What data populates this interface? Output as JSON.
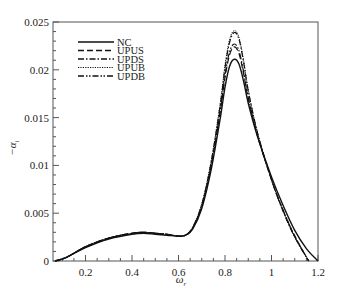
{
  "chart_data": {
    "type": "line",
    "title": "",
    "xlabel": "ω_r",
    "ylabel": "−α_i",
    "xlim": [
      0.06,
      1.2
    ],
    "ylim": [
      0,
      0.025
    ],
    "xticks": [
      0.2,
      0.4,
      0.6,
      0.8,
      1.0,
      1.2
    ],
    "xtick_labels": [
      "0.2",
      "0.4",
      "0.6",
      "0.8",
      "1",
      "1.2"
    ],
    "yticks": [
      0,
      0.005,
      0.01,
      0.015,
      0.02,
      0.025
    ],
    "ytick_labels": [
      "0",
      "0.005",
      "0.01",
      "0.015",
      "0.02",
      "0.025"
    ],
    "grid": false,
    "legend_position": "upper-left",
    "series": [
      {
        "name": "NC",
        "style": "solid",
        "x": [
          0.07,
          0.12,
          0.2,
          0.3,
          0.4,
          0.45,
          0.5,
          0.55,
          0.6,
          0.63,
          0.66,
          0.7,
          0.74,
          0.78,
          0.8,
          0.82,
          0.84,
          0.86,
          0.88,
          0.9,
          0.94,
          1.0,
          1.05,
          1.1,
          1.15,
          1.2
        ],
        "y": [
          0,
          0.0004,
          0.0014,
          0.0023,
          0.0028,
          0.0029,
          0.0028,
          0.0027,
          0.0026,
          0.0027,
          0.0033,
          0.0055,
          0.0095,
          0.015,
          0.0182,
          0.0204,
          0.0211,
          0.0206,
          0.0188,
          0.0165,
          0.013,
          0.0088,
          0.0058,
          0.0032,
          0.0013,
          0
        ]
      },
      {
        "name": "UPUS",
        "style": "dashed",
        "x": [
          0.07,
          0.12,
          0.2,
          0.3,
          0.4,
          0.45,
          0.5,
          0.55,
          0.6,
          0.63,
          0.66,
          0.7,
          0.74,
          0.78,
          0.8,
          0.82,
          0.84,
          0.86,
          0.88,
          0.9,
          0.94,
          1.0,
          1.05,
          1.1,
          1.16
        ],
        "y": [
          0,
          0.0004,
          0.0015,
          0.0024,
          0.0029,
          0.003,
          0.0029,
          0.0028,
          0.0026,
          0.0027,
          0.0034,
          0.0057,
          0.0099,
          0.0157,
          0.0192,
          0.0216,
          0.0224,
          0.0217,
          0.0196,
          0.017,
          0.0131,
          0.0085,
          0.0053,
          0.0026,
          0
        ]
      },
      {
        "name": "UPDS",
        "style": "dashdot",
        "x": [
          0.07,
          0.12,
          0.2,
          0.3,
          0.4,
          0.45,
          0.5,
          0.55,
          0.6,
          0.63,
          0.66,
          0.7,
          0.74,
          0.78,
          0.8,
          0.82,
          0.84,
          0.86,
          0.88,
          0.9,
          0.94,
          1.0,
          1.05,
          1.1,
          1.16
        ],
        "y": [
          0,
          0.0004,
          0.0015,
          0.0024,
          0.0029,
          0.003,
          0.0029,
          0.0028,
          0.0026,
          0.0027,
          0.0035,
          0.0059,
          0.0103,
          0.0164,
          0.0202,
          0.0229,
          0.0239,
          0.0232,
          0.0208,
          0.0178,
          0.0134,
          0.0085,
          0.0052,
          0.0025,
          0
        ]
      },
      {
        "name": "UPUB",
        "style": "dotted",
        "x": [
          0.07,
          0.12,
          0.2,
          0.3,
          0.4,
          0.45,
          0.5,
          0.55,
          0.6,
          0.63,
          0.66,
          0.7,
          0.74,
          0.78,
          0.8,
          0.82,
          0.84,
          0.86,
          0.88,
          0.9,
          0.94,
          1.0,
          1.05,
          1.1,
          1.16
        ],
        "y": [
          0,
          0.0004,
          0.0015,
          0.0024,
          0.0029,
          0.003,
          0.0029,
          0.0028,
          0.0026,
          0.0027,
          0.0035,
          0.006,
          0.0104,
          0.0166,
          0.0205,
          0.0232,
          0.0241,
          0.0234,
          0.021,
          0.0179,
          0.0134,
          0.0085,
          0.0052,
          0.0025,
          0
        ]
      },
      {
        "name": "UPDB",
        "style": "dashdotdot",
        "x": [
          0.07,
          0.12,
          0.2,
          0.3,
          0.4,
          0.45,
          0.5,
          0.55,
          0.6,
          0.63,
          0.66,
          0.7,
          0.74,
          0.78,
          0.8,
          0.82,
          0.84,
          0.86,
          0.88,
          0.9,
          0.94,
          1.0,
          1.05,
          1.1,
          1.16
        ],
        "y": [
          0,
          0.0004,
          0.0015,
          0.0024,
          0.0029,
          0.003,
          0.0029,
          0.0028,
          0.0026,
          0.0027,
          0.0034,
          0.0058,
          0.01,
          0.0159,
          0.0195,
          0.0219,
          0.0227,
          0.022,
          0.0198,
          0.0171,
          0.0131,
          0.0085,
          0.0053,
          0.0026,
          0
        ]
      }
    ]
  },
  "legend": {
    "items": [
      {
        "label": "NC"
      },
      {
        "label": "UPUS"
      },
      {
        "label": "UPDS"
      },
      {
        "label": "UPUB"
      },
      {
        "label": "UPDB"
      }
    ]
  },
  "axes": {
    "xlabel_main": "ω",
    "xlabel_sub": "r",
    "ylabel_main": "−α",
    "ylabel_sub": "i"
  }
}
